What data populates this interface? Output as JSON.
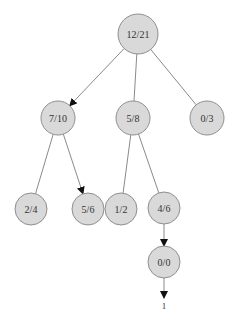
{
  "diagram": {
    "type": "tree",
    "colors": {
      "node_fill": "#d9d9d9",
      "node_stroke": "#8f8f8f",
      "edge": "#8a8a8a",
      "arrow": "#111111",
      "text": "#333333"
    },
    "nodes": [
      {
        "id": "n0",
        "label": "12/21",
        "x": 138,
        "y": 34,
        "r": 20
      },
      {
        "id": "n1",
        "label": "7/10",
        "x": 58,
        "y": 118,
        "r": 17
      },
      {
        "id": "n2",
        "label": "5/8",
        "x": 133,
        "y": 118,
        "r": 17
      },
      {
        "id": "n3",
        "label": "0/3",
        "x": 207,
        "y": 118,
        "r": 17
      },
      {
        "id": "n4",
        "label": "2/4",
        "x": 31,
        "y": 209,
        "r": 16
      },
      {
        "id": "n5",
        "label": "5/6",
        "x": 88,
        "y": 209,
        "r": 16
      },
      {
        "id": "n6",
        "label": "1/2",
        "x": 121,
        "y": 209,
        "r": 16
      },
      {
        "id": "n7",
        "label": "4/6",
        "x": 164,
        "y": 208,
        "r": 16
      },
      {
        "id": "n8",
        "label": "0/0",
        "x": 164,
        "y": 262,
        "r": 16
      }
    ],
    "edges": [
      {
        "from": "n0",
        "to": "n1",
        "arrow": true
      },
      {
        "from": "n0",
        "to": "n2",
        "arrow": false
      },
      {
        "from": "n0",
        "to": "n3",
        "arrow": false
      },
      {
        "from": "n1",
        "to": "n4",
        "arrow": false
      },
      {
        "from": "n1",
        "to": "n5",
        "arrow": true
      },
      {
        "from": "n2",
        "to": "n6",
        "arrow": false
      },
      {
        "from": "n2",
        "to": "n7",
        "arrow": false
      },
      {
        "from": "n7",
        "to": "n8",
        "arrow": true
      }
    ],
    "terminal": {
      "label": "1",
      "x": 164,
      "y": 306,
      "from": "n8"
    }
  }
}
